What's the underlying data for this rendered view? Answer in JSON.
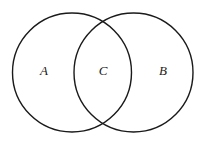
{
  "figure": {
    "type": "venn-diagram",
    "background_color": "#ffffff",
    "stroke_color": "#1a1a1a",
    "stroke_width": 1.4,
    "label_color": "#1a1a1a",
    "canvas": {
      "width": 207,
      "height": 149
    }
  },
  "circles": [
    {
      "id": "left-circle",
      "name": "set-a-circle",
      "cx": 72,
      "cy": 72.5,
      "r": 59.5,
      "fill": "none",
      "stroke": "#1a1a1a"
    },
    {
      "id": "right-circle",
      "name": "set-b-circle",
      "cx": 133.5,
      "cy": 72.5,
      "r": 59.5,
      "fill": "none",
      "stroke": "#1a1a1a"
    }
  ],
  "labels": [
    {
      "id": "label-a",
      "text": "A",
      "x": 44,
      "y": 72,
      "region": "left-only"
    },
    {
      "id": "label-c",
      "text": "C",
      "x": 103,
      "y": 72,
      "region": "intersection"
    },
    {
      "id": "label-b",
      "text": "B",
      "x": 163,
      "y": 72,
      "region": "right-only"
    }
  ]
}
